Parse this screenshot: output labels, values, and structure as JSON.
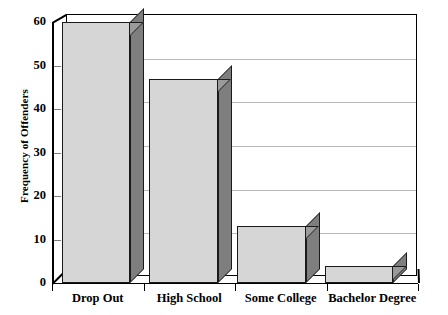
{
  "chart_data": {
    "type": "bar",
    "title": "",
    "xlabel": "",
    "ylabel": "Frequency of Offenders",
    "categories": [
      "Drop Out",
      "High School",
      "Some College",
      "Bachelor Degree"
    ],
    "values": [
      60,
      47,
      13,
      4
    ],
    "ylim": [
      0,
      60
    ],
    "yticks": [
      0,
      10,
      20,
      30,
      40,
      50,
      60
    ],
    "ytick_labels": [
      "0",
      "10",
      "20",
      "30",
      "40",
      "50",
      "60"
    ],
    "grid": true,
    "legend": "none",
    "style": "3d-bar",
    "colors": {
      "bar_front": "#d6d6d6",
      "bar_side": "#7e7e7e",
      "bar_top": "#9a9a9a",
      "bar_border": "#1a1a1a",
      "gridline": "#b9b9b9",
      "axis": "#000000",
      "background": "#ffffff"
    }
  }
}
